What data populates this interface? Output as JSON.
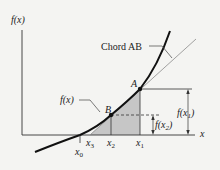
{
  "diagram": {
    "axes": {
      "y_label": "f(x)",
      "x_label": "x"
    },
    "curve_label": "f(x)",
    "chord_label": "Chord AB",
    "points": [
      {
        "id": "A",
        "label": "A"
      },
      {
        "id": "B",
        "label": "B"
      }
    ],
    "x_ticks": [
      {
        "id": "x0",
        "base": "x",
        "sub": "0"
      },
      {
        "id": "x3",
        "base": "x",
        "sub": "3"
      },
      {
        "id": "x2",
        "base": "x",
        "sub": "2"
      },
      {
        "id": "x1",
        "base": "x",
        "sub": "1"
      }
    ],
    "dimensions": [
      {
        "id": "fx1",
        "text_pre": "f(x",
        "sub": "1",
        "text_post": ")"
      },
      {
        "id": "fx2",
        "text_pre": "f(x",
        "sub": "2",
        "text_post": ")"
      }
    ],
    "colors": {
      "background": "#f4f4f2",
      "ink": "#222222",
      "shade": "#c4c4c4",
      "chord": "#9a9a9a"
    }
  }
}
